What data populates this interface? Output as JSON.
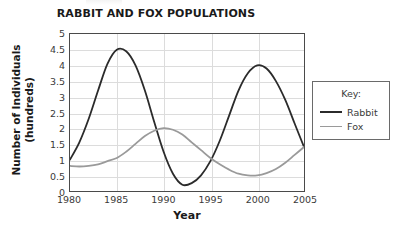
{
  "chart_data": {
    "type": "line",
    "title": "RABBIT AND FOX POPULATIONS",
    "xlabel": "Year",
    "ylabel": "Number of Individuals (hundreds)",
    "ylabel_lines": [
      "Number of Individuals",
      "(hundreds)"
    ],
    "xlim": [
      1980,
      2005
    ],
    "ylim": [
      0,
      5
    ],
    "xticks": [
      1980,
      1985,
      1990,
      1995,
      2000,
      2005
    ],
    "xticklabels": [
      "1980",
      "1985",
      "1990",
      "1995",
      "2000",
      "2005"
    ],
    "yticks": [
      0,
      0.5,
      1,
      1.5,
      2,
      2.5,
      3,
      3.5,
      4,
      4.5,
      5
    ],
    "yticklabels": [
      "0",
      "0.5",
      "1",
      "1.5",
      "2",
      "2.5",
      "3",
      "3.5",
      "4",
      "4.5",
      "5"
    ],
    "grid": "horizontal-and-vertical",
    "legend_position": "right-outside",
    "legend_title": "Key:",
    "series": [
      {
        "name": "Rabbit",
        "color": "#2b2b2b",
        "width": 1.8,
        "x": [
          1980,
          1981,
          1982,
          1983,
          1984,
          1985,
          1986,
          1987,
          1988,
          1989,
          1990,
          1991,
          1992,
          1993,
          1994,
          1995,
          1996,
          1997,
          1998,
          1999,
          2000,
          2001,
          2002,
          2003,
          2004,
          2005
        ],
        "values": [
          1.0,
          1.55,
          2.3,
          3.2,
          4.05,
          4.5,
          4.45,
          4.0,
          3.2,
          2.2,
          1.25,
          0.55,
          0.2,
          0.25,
          0.5,
          0.95,
          1.6,
          2.4,
          3.2,
          3.75,
          4.0,
          3.9,
          3.5,
          2.9,
          2.15,
          1.4
        ]
      },
      {
        "name": "Fox",
        "color": "#9a9a9a",
        "width": 1.8,
        "x": [
          1980,
          1981,
          1982,
          1983,
          1984,
          1985,
          1986,
          1987,
          1988,
          1989,
          1990,
          1991,
          1992,
          1993,
          1994,
          1995,
          1996,
          1997,
          1998,
          1999,
          2000,
          2001,
          2002,
          2003,
          2004,
          2005
        ],
        "values": [
          0.8,
          0.78,
          0.8,
          0.85,
          0.95,
          1.05,
          1.25,
          1.5,
          1.75,
          1.92,
          2.0,
          1.95,
          1.8,
          1.55,
          1.3,
          1.05,
          0.85,
          0.68,
          0.55,
          0.5,
          0.5,
          0.57,
          0.7,
          0.9,
          1.15,
          1.4
        ]
      }
    ],
    "annotations": [
      {
        "text": "Rabbit peak 4.5 at 1985"
      },
      {
        "text": "Rabbit minimum 0.2 at 1992"
      },
      {
        "text": "Rabbit peak 4.0 at 2000"
      },
      {
        "text": "Fox peak 2.0 at 1990"
      },
      {
        "text": "Fox minimum 0.5 near 1999"
      }
    ]
  },
  "legend": {
    "title": "Key:",
    "entries": [
      {
        "label": "Rabbit",
        "color": "#2b2b2b"
      },
      {
        "label": "Fox",
        "color": "#9a9a9a"
      }
    ]
  },
  "colors": {
    "rabbit": "#2b2b2b",
    "fox": "#9a9a9a",
    "axis": "#4a4a4a",
    "grid": "#dcdcdc",
    "text": "#1a1a1a",
    "tick_text": "#3a3a3a",
    "legend_border": "#6a6a6a",
    "background": "#ffffff"
  }
}
